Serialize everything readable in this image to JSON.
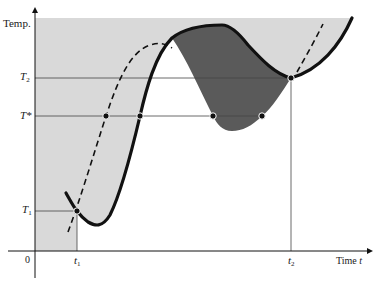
{
  "axes": {
    "y_label": "Temp.",
    "x_label": "Time",
    "x_label_var": "t",
    "origin_label": "0"
  },
  "temperature_levels": [
    {
      "name": "T2",
      "symbol": "T",
      "sub": "2",
      "y": 78
    },
    {
      "name": "T*",
      "symbol": "T*",
      "sub": "",
      "y": 116
    },
    {
      "name": "T1",
      "symbol": "T",
      "sub": "1",
      "y": 211
    }
  ],
  "time_marks": [
    {
      "name": "t1",
      "symbol": "t",
      "sub": "1",
      "x": 77
    },
    {
      "name": "t2",
      "symbol": "t",
      "sub": "2",
      "x": 291
    }
  ],
  "colors": {
    "light_shade": "#d9d9d9",
    "dark_shade": "#5a5a5a",
    "curve": "#111111",
    "grid_line": "#555555"
  },
  "intersection_points": [
    {
      "x": 77,
      "y": 211
    },
    {
      "x": 106,
      "y": 116
    },
    {
      "x": 140,
      "y": 116
    },
    {
      "x": 213,
      "y": 116
    },
    {
      "x": 262,
      "y": 116
    },
    {
      "x": 291,
      "y": 78
    }
  ],
  "curves": {
    "solid": "temperature trajectory",
    "dashed": "comparison trajectory"
  }
}
